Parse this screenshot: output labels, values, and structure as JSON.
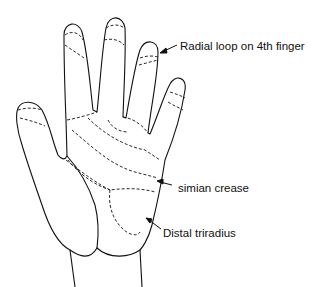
{
  "diagram": {
    "labels": [
      {
        "id": "radial-loop",
        "text": "Radial loop on 4th finger"
      },
      {
        "id": "simian-crease",
        "text": "simian crease"
      },
      {
        "id": "distal-triradius",
        "text": "Distal triradius"
      }
    ],
    "colors": {
      "line": "#111111",
      "background": "#ffffff"
    }
  }
}
